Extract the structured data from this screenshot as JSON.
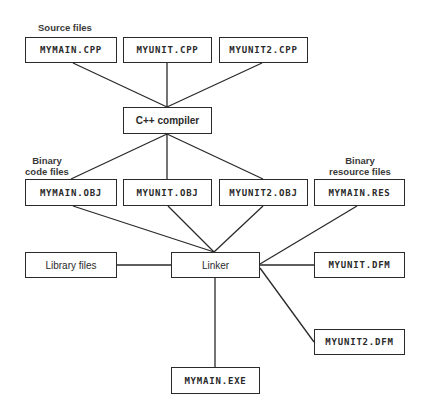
{
  "labels": {
    "source": "Source files",
    "binary_code_line1": "Binary",
    "binary_code_line2": "code files",
    "binary_res_line1": "Binary",
    "binary_res_line2": "resource files"
  },
  "nodes": {
    "mymain_cpp": "MYMAIN.CPP",
    "myunit_cpp": "MYUNIT.CPP",
    "myunit2_cpp": "MYUNIT2.CPP",
    "compiler": "C++ compiler",
    "mymain_obj": "MYMAIN.OBJ",
    "myunit_obj": "MYUNIT.OBJ",
    "myunit2_obj": "MYUNIT2.OBJ",
    "mymain_res": "MYMAIN.RES",
    "library": "Library files",
    "linker": "Linker",
    "myunit_dfm": "MYUNIT.DFM",
    "myunit2_dfm": "MYUNIT2.DFM",
    "mymain_exe": "MYMAIN.EXE"
  },
  "edges": [
    [
      "MYMAIN.CPP",
      "C++ compiler"
    ],
    [
      "MYUNIT.CPP",
      "C++ compiler"
    ],
    [
      "MYUNIT2.CPP",
      "C++ compiler"
    ],
    [
      "C++ compiler",
      "MYMAIN.OBJ"
    ],
    [
      "C++ compiler",
      "MYUNIT.OBJ"
    ],
    [
      "C++ compiler",
      "MYUNIT2.OBJ"
    ],
    [
      "MYMAIN.OBJ",
      "Linker"
    ],
    [
      "MYUNIT.OBJ",
      "Linker"
    ],
    [
      "MYUNIT2.OBJ",
      "Linker"
    ],
    [
      "MYMAIN.RES",
      "Linker"
    ],
    [
      "Library files",
      "Linker"
    ],
    [
      "MYUNIT.DFM",
      "Linker"
    ],
    [
      "MYUNIT2.DFM",
      "Linker"
    ],
    [
      "Linker",
      "MYMAIN.EXE"
    ]
  ],
  "colors": {
    "stroke": "#2a2a2a",
    "text": "#2a2a2a",
    "background": "#ffffff"
  }
}
